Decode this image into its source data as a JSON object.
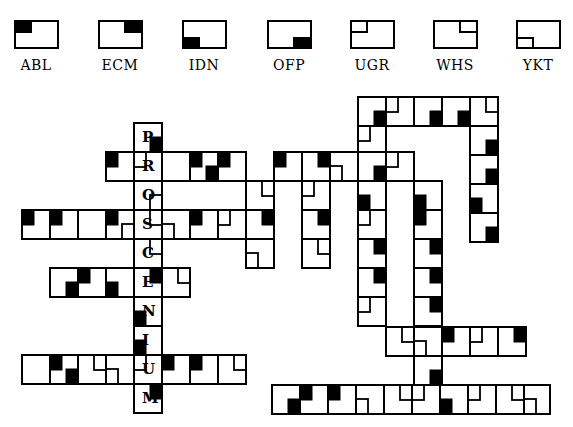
{
  "legend": [
    {
      "code": "ABL",
      "corner": "tl",
      "style": "filled"
    },
    {
      "code": "ECM",
      "corner": "tr",
      "style": "filled"
    },
    {
      "code": "IDN",
      "corner": "bl",
      "style": "filled"
    },
    {
      "code": "OFP",
      "corner": "br",
      "style": "filled"
    },
    {
      "code": "UGR",
      "corner": "tl",
      "style": "outline"
    },
    {
      "code": "WHS",
      "corner": "tr",
      "style": "outline"
    },
    {
      "code": "YKT",
      "corner": "bl",
      "style": "outline"
    }
  ],
  "keyword": {
    "letters": [
      "P",
      "R",
      "O",
      "S",
      "C",
      "E",
      "N",
      "I",
      "U",
      "M"
    ],
    "word": "PROSCENIUM"
  },
  "grid": {
    "colors": {
      "line": "#000000",
      "fill": "#000000",
      "background": "#ffffff"
    },
    "cells": [
      {
        "x": 134,
        "y": 123,
        "w": 28,
        "h": 29,
        "letter": "P",
        "marks": [
          [
            "br",
            "filled"
          ]
        ]
      },
      {
        "x": 106,
        "y": 152,
        "w": 28,
        "h": 29,
        "marks": [
          [
            "tl",
            "filled"
          ]
        ]
      },
      {
        "x": 134,
        "y": 152,
        "w": 28,
        "h": 29,
        "letter": "R",
        "marks": [
          [
            "tl",
            "outline"
          ]
        ]
      },
      {
        "x": 162,
        "y": 152,
        "w": 28,
        "h": 29,
        "marks": []
      },
      {
        "x": 190,
        "y": 152,
        "w": 28,
        "h": 29,
        "marks": [
          [
            "tl",
            "filled"
          ],
          [
            "br",
            "filled"
          ]
        ]
      },
      {
        "x": 218,
        "y": 152,
        "w": 28,
        "h": 29,
        "marks": [
          [
            "tl",
            "filled"
          ]
        ]
      },
      {
        "x": 274,
        "y": 152,
        "w": 28,
        "h": 29,
        "marks": [
          [
            "tl",
            "filled"
          ]
        ]
      },
      {
        "x": 302,
        "y": 152,
        "w": 28,
        "h": 29,
        "marks": [
          [
            "tr",
            "filled"
          ]
        ]
      },
      {
        "x": 330,
        "y": 152,
        "w": 28,
        "h": 29,
        "marks": [
          [
            "bl",
            "outline"
          ]
        ]
      },
      {
        "x": 358,
        "y": 152,
        "w": 28,
        "h": 29,
        "marks": [
          [
            "br",
            "filled"
          ]
        ]
      },
      {
        "x": 386,
        "y": 152,
        "w": 28,
        "h": 29,
        "marks": [
          [
            "tl",
            "outline"
          ]
        ]
      },
      {
        "x": 134,
        "y": 181,
        "w": 28,
        "h": 29,
        "letter": "O",
        "marks": [
          [
            "br",
            "outline"
          ]
        ]
      },
      {
        "x": 246,
        "y": 181,
        "w": 28,
        "h": 29,
        "marks": [
          [
            "tr",
            "outline"
          ]
        ]
      },
      {
        "x": 302,
        "y": 181,
        "w": 28,
        "h": 29,
        "marks": [
          [
            "tl",
            "outline"
          ]
        ]
      },
      {
        "x": 358,
        "y": 181,
        "w": 28,
        "h": 29,
        "marks": [
          [
            "bl",
            "filled"
          ]
        ]
      },
      {
        "x": 414,
        "y": 181,
        "w": 28,
        "h": 29,
        "marks": [
          [
            "bl",
            "filled"
          ]
        ]
      },
      {
        "x": 22,
        "y": 210,
        "w": 28,
        "h": 29,
        "marks": [
          [
            "tl",
            "filled"
          ]
        ]
      },
      {
        "x": 50,
        "y": 210,
        "w": 28,
        "h": 29,
        "marks": [
          [
            "tl",
            "filled"
          ]
        ]
      },
      {
        "x": 78,
        "y": 210,
        "w": 28,
        "h": 29,
        "marks": []
      },
      {
        "x": 106,
        "y": 210,
        "w": 28,
        "h": 29,
        "marks": [
          [
            "tl",
            "filled"
          ],
          [
            "br",
            "outline"
          ]
        ]
      },
      {
        "x": 134,
        "y": 210,
        "w": 28,
        "h": 29,
        "letter": "S",
        "marks": [
          [
            "tr",
            "outline"
          ]
        ]
      },
      {
        "x": 162,
        "y": 210,
        "w": 28,
        "h": 29,
        "marks": [
          [
            "bl",
            "outline"
          ]
        ]
      },
      {
        "x": 190,
        "y": 210,
        "w": 28,
        "h": 29,
        "marks": [
          [
            "tl",
            "filled"
          ]
        ]
      },
      {
        "x": 218,
        "y": 210,
        "w": 28,
        "h": 29,
        "marks": [
          [
            "tl",
            "outline"
          ]
        ]
      },
      {
        "x": 246,
        "y": 210,
        "w": 28,
        "h": 29,
        "marks": [
          [
            "tr",
            "filled"
          ]
        ]
      },
      {
        "x": 302,
        "y": 210,
        "w": 28,
        "h": 29,
        "marks": [
          [
            "tr",
            "filled"
          ]
        ]
      },
      {
        "x": 358,
        "y": 210,
        "w": 28,
        "h": 29,
        "marks": [
          [
            "tl",
            "outline"
          ]
        ]
      },
      {
        "x": 414,
        "y": 210,
        "w": 28,
        "h": 29,
        "marks": [
          [
            "tl",
            "filled"
          ]
        ]
      },
      {
        "x": 134,
        "y": 239,
        "w": 28,
        "h": 29,
        "letter": "C",
        "marks": [
          [
            "tr",
            "outline"
          ]
        ]
      },
      {
        "x": 246,
        "y": 239,
        "w": 28,
        "h": 29,
        "marks": [
          [
            "bl",
            "outline"
          ]
        ]
      },
      {
        "x": 302,
        "y": 239,
        "w": 28,
        "h": 29,
        "marks": [
          [
            "tr",
            "outline"
          ]
        ]
      },
      {
        "x": 358,
        "y": 239,
        "w": 28,
        "h": 29,
        "marks": [
          [
            "tr",
            "filled"
          ]
        ]
      },
      {
        "x": 414,
        "y": 239,
        "w": 28,
        "h": 29,
        "marks": [
          [
            "tr",
            "filled"
          ]
        ]
      },
      {
        "x": 50,
        "y": 268,
        "w": 28,
        "h": 29,
        "marks": [
          [
            "br",
            "filled"
          ]
        ]
      },
      {
        "x": 78,
        "y": 268,
        "w": 28,
        "h": 29,
        "marks": [
          [
            "tl",
            "filled"
          ]
        ]
      },
      {
        "x": 106,
        "y": 268,
        "w": 28,
        "h": 29,
        "marks": [
          [
            "bl",
            "filled"
          ]
        ]
      },
      {
        "x": 134,
        "y": 268,
        "w": 28,
        "h": 29,
        "letter": "E",
        "marks": [
          [
            "tr",
            "filled"
          ]
        ]
      },
      {
        "x": 162,
        "y": 268,
        "w": 28,
        "h": 29,
        "marks": [
          [
            "tr",
            "outline"
          ]
        ]
      },
      {
        "x": 358,
        "y": 268,
        "w": 28,
        "h": 29,
        "marks": [
          [
            "tr",
            "filled"
          ]
        ]
      },
      {
        "x": 414,
        "y": 268,
        "w": 28,
        "h": 29,
        "marks": [
          [
            "tr",
            "filled"
          ]
        ]
      },
      {
        "x": 134,
        "y": 297,
        "w": 28,
        "h": 29,
        "letter": "N",
        "marks": [
          [
            "bl",
            "filled"
          ]
        ]
      },
      {
        "x": 358,
        "y": 297,
        "w": 28,
        "h": 29,
        "marks": [
          [
            "tl",
            "outline"
          ]
        ]
      },
      {
        "x": 414,
        "y": 297,
        "w": 28,
        "h": 29,
        "marks": [
          [
            "tr",
            "filled"
          ]
        ]
      },
      {
        "x": 134,
        "y": 326,
        "w": 28,
        "h": 29,
        "letter": "I",
        "marks": [
          [
            "bl",
            "filled"
          ]
        ]
      },
      {
        "x": 386,
        "y": 327,
        "w": 28,
        "h": 29,
        "marks": [
          [
            "tr",
            "outline"
          ]
        ]
      },
      {
        "x": 414,
        "y": 327,
        "w": 28,
        "h": 29,
        "marks": [
          [
            "bl",
            "outline"
          ]
        ]
      },
      {
        "x": 442,
        "y": 327,
        "w": 28,
        "h": 29,
        "marks": [
          [
            "tl",
            "filled"
          ]
        ]
      },
      {
        "x": 470,
        "y": 327,
        "w": 28,
        "h": 29,
        "marks": [
          [
            "tl",
            "outline"
          ]
        ]
      },
      {
        "x": 498,
        "y": 327,
        "w": 28,
        "h": 29,
        "marks": [
          [
            "tr",
            "filled"
          ]
        ]
      },
      {
        "x": 22,
        "y": 355,
        "w": 28,
        "h": 29,
        "marks": []
      },
      {
        "x": 50,
        "y": 355,
        "w": 28,
        "h": 29,
        "marks": [
          [
            "tl",
            "filled"
          ],
          [
            "br",
            "filled"
          ]
        ]
      },
      {
        "x": 78,
        "y": 355,
        "w": 28,
        "h": 29,
        "marks": [
          [
            "tr",
            "outline"
          ]
        ]
      },
      {
        "x": 106,
        "y": 355,
        "w": 28,
        "h": 29,
        "marks": [
          [
            "bl",
            "outline"
          ]
        ]
      },
      {
        "x": 134,
        "y": 355,
        "w": 28,
        "h": 29,
        "letter": "U",
        "marks": [
          [
            "tl",
            "outline"
          ]
        ]
      },
      {
        "x": 162,
        "y": 355,
        "w": 28,
        "h": 29,
        "marks": [
          [
            "tl",
            "filled"
          ]
        ]
      },
      {
        "x": 190,
        "y": 355,
        "w": 28,
        "h": 29,
        "marks": [
          [
            "tl",
            "filled"
          ]
        ]
      },
      {
        "x": 218,
        "y": 355,
        "w": 28,
        "h": 29,
        "marks": [
          [
            "tr",
            "outline"
          ]
        ]
      },
      {
        "x": 414,
        "y": 356,
        "w": 28,
        "h": 29,
        "marks": [
          [
            "br",
            "filled"
          ]
        ]
      },
      {
        "x": 134,
        "y": 384,
        "w": 28,
        "h": 29,
        "letter": "M",
        "marks": [
          [
            "tr",
            "filled"
          ]
        ]
      },
      {
        "x": 358,
        "y": 97,
        "w": 28,
        "h": 29,
        "marks": [
          [
            "br",
            "filled"
          ]
        ]
      },
      {
        "x": 386,
        "y": 97,
        "w": 28,
        "h": 29,
        "marks": [
          [
            "tl",
            "outline"
          ]
        ]
      },
      {
        "x": 414,
        "y": 97,
        "w": 28,
        "h": 29,
        "marks": [
          [
            "br",
            "filled"
          ]
        ]
      },
      {
        "x": 442,
        "y": 97,
        "w": 28,
        "h": 29,
        "marks": [
          [
            "br",
            "filled"
          ]
        ]
      },
      {
        "x": 470,
        "y": 97,
        "w": 28,
        "h": 29,
        "marks": [
          [
            "tr",
            "outline"
          ]
        ]
      },
      {
        "x": 358,
        "y": 126,
        "w": 28,
        "h": 26,
        "marks": [
          [
            "tl",
            "outline"
          ]
        ]
      },
      {
        "x": 470,
        "y": 126,
        "w": 28,
        "h": 29,
        "marks": [
          [
            "br",
            "filled"
          ]
        ]
      },
      {
        "x": 470,
        "y": 155,
        "w": 28,
        "h": 29,
        "marks": [
          [
            "br",
            "filled"
          ]
        ]
      },
      {
        "x": 470,
        "y": 184,
        "w": 28,
        "h": 29,
        "marks": [
          [
            "bl",
            "filled"
          ]
        ]
      },
      {
        "x": 470,
        "y": 213,
        "w": 28,
        "h": 29,
        "marks": [
          [
            "br",
            "filled"
          ]
        ]
      },
      {
        "x": 272,
        "y": 385,
        "w": 28,
        "h": 29,
        "marks": [
          [
            "br",
            "filled"
          ]
        ]
      },
      {
        "x": 300,
        "y": 385,
        "w": 28,
        "h": 29,
        "marks": [
          [
            "tl",
            "filled"
          ]
        ]
      },
      {
        "x": 328,
        "y": 385,
        "w": 28,
        "h": 29,
        "marks": [
          [
            "tl",
            "filled"
          ]
        ]
      },
      {
        "x": 356,
        "y": 385,
        "w": 28,
        "h": 29,
        "marks": [
          [
            "bl",
            "outline"
          ]
        ]
      },
      {
        "x": 384,
        "y": 385,
        "w": 28,
        "h": 29,
        "marks": [
          [
            "tr",
            "outline"
          ]
        ]
      },
      {
        "x": 412,
        "y": 385,
        "w": 28,
        "h": 29,
        "marks": [
          [
            "tl",
            "outline"
          ]
        ]
      },
      {
        "x": 440,
        "y": 385,
        "w": 28,
        "h": 29,
        "marks": [
          [
            "bl",
            "filled"
          ]
        ]
      },
      {
        "x": 468,
        "y": 385,
        "w": 28,
        "h": 29,
        "marks": [
          [
            "tl",
            "outline"
          ]
        ]
      },
      {
        "x": 496,
        "y": 385,
        "w": 28,
        "h": 29,
        "marks": [
          [
            "tr",
            "outline"
          ]
        ]
      },
      {
        "x": 524,
        "y": 385,
        "w": 26,
        "h": 29,
        "marks": [
          [
            "bl",
            "outline"
          ]
        ]
      }
    ]
  }
}
